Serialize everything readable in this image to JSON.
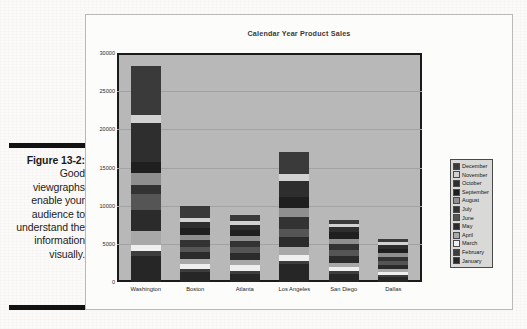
{
  "caption": {
    "figure_number": "Figure 13-2:",
    "text": "Good viewgraphs enable your audience to understand the information visually."
  },
  "chart_data": {
    "type": "bar",
    "subtype": "stacked-column",
    "title": "Calendar Year Product Sales",
    "xlabel": "",
    "ylabel": "",
    "ylim": [
      0,
      30000
    ],
    "yticks": [
      "0",
      "5000",
      "10000",
      "15000",
      "20000",
      "25000",
      "30000"
    ],
    "ytick_values": [
      0,
      5000,
      10000,
      15000,
      20000,
      25000,
      30000
    ],
    "grid": true,
    "legend_position": "right",
    "legend_order": [
      "December",
      "November",
      "October",
      "September",
      "August",
      "July",
      "June",
      "May",
      "April",
      "March",
      "February",
      "January"
    ],
    "categories": [
      "Washington",
      "Boston",
      "Atlanta",
      "Los Angeles",
      "San Diego",
      "Dallas"
    ],
    "series": [
      {
        "name": "January",
        "color": "#262626",
        "values": [
          3400,
          1250,
          1000,
          2400,
          1000,
          600
        ]
      },
      {
        "name": "February",
        "color": "#3d3d3d",
        "values": [
          600,
          500,
          500,
          300,
          500,
          300
        ]
      },
      {
        "name": "March",
        "color": "#efefef",
        "values": [
          800,
          600,
          700,
          900,
          450,
          350
        ]
      },
      {
        "name": "April",
        "color": "#a8a8a8",
        "values": [
          1900,
          700,
          750,
          1000,
          550,
          400
        ]
      },
      {
        "name": "May",
        "color": "#2b2b2b",
        "values": [
          2800,
          900,
          900,
          1300,
          900,
          600
        ]
      },
      {
        "name": "June",
        "color": "#555555",
        "values": [
          2000,
          700,
          700,
          1100,
          800,
          500
        ]
      },
      {
        "name": "July",
        "color": "#333333",
        "values": [
          1200,
          800,
          800,
          1500,
          750,
          550
        ]
      },
      {
        "name": "August",
        "color": "#8f8f8f",
        "values": [
          1600,
          700,
          650,
          1200,
          700,
          450
        ]
      },
      {
        "name": "September",
        "color": "#1f1f1f",
        "values": [
          1400,
          900,
          800,
          1500,
          850,
          600
        ]
      },
      {
        "name": "October",
        "color": "#2e2e2e",
        "values": [
          5200,
          850,
          700,
          2000,
          700,
          500
        ]
      },
      {
        "name": "November",
        "color": "#d2d2d2",
        "values": [
          1000,
          500,
          450,
          900,
          400,
          350
        ]
      },
      {
        "name": "December",
        "color": "#3a3a3a",
        "values": [
          6400,
          1600,
          850,
          2900,
          600,
          500
        ]
      }
    ],
    "totals": [
      28300,
      10000,
      8800,
      17000,
      8200,
      5700
    ]
  }
}
